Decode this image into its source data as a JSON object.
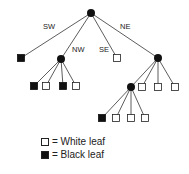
{
  "diagram": {
    "type": "quadtree",
    "edge_labels": {
      "sw": "SW",
      "nw": "NW",
      "se": "SE",
      "ne": "NE"
    },
    "nodes": [
      {
        "id": "root",
        "kind": "internal",
        "x": 91,
        "y": 13
      },
      {
        "id": "sw",
        "kind": "black-leaf",
        "x": 21,
        "y": 58,
        "parent": "root"
      },
      {
        "id": "nw",
        "kind": "internal",
        "x": 61,
        "y": 59,
        "parent": "root"
      },
      {
        "id": "se",
        "kind": "white-leaf",
        "x": 117,
        "y": 58,
        "parent": "root"
      },
      {
        "id": "ne",
        "kind": "internal",
        "x": 158,
        "y": 58,
        "parent": "root"
      },
      {
        "id": "nw1",
        "kind": "black-leaf",
        "x": 34,
        "y": 86,
        "parent": "nw"
      },
      {
        "id": "nw2",
        "kind": "white-leaf",
        "x": 46,
        "y": 86,
        "parent": "nw"
      },
      {
        "id": "nw3",
        "kind": "black-leaf",
        "x": 63,
        "y": 86,
        "parent": "nw"
      },
      {
        "id": "nw4",
        "kind": "white-leaf",
        "x": 76,
        "y": 86,
        "parent": "nw"
      },
      {
        "id": "ne1",
        "kind": "internal",
        "x": 131,
        "y": 87,
        "parent": "ne"
      },
      {
        "id": "ne2",
        "kind": "white-leaf",
        "x": 142,
        "y": 87,
        "parent": "ne"
      },
      {
        "id": "ne3",
        "kind": "white-leaf",
        "x": 158,
        "y": 87,
        "parent": "ne"
      },
      {
        "id": "ne4",
        "kind": "white-leaf",
        "x": 175,
        "y": 87,
        "parent": "ne"
      },
      {
        "id": "ne1a",
        "kind": "black-leaf",
        "x": 102,
        "y": 118,
        "parent": "ne1"
      },
      {
        "id": "ne1b",
        "kind": "white-leaf",
        "x": 116,
        "y": 118,
        "parent": "ne1"
      },
      {
        "id": "ne1c",
        "kind": "white-leaf",
        "x": 131,
        "y": 118,
        "parent": "ne1"
      },
      {
        "id": "ne1d",
        "kind": "white-leaf",
        "x": 145,
        "y": 118,
        "parent": "ne1"
      }
    ]
  },
  "legend": {
    "white": "= White leaf",
    "black": "= Black leaf"
  }
}
